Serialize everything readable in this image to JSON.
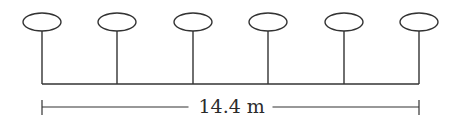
{
  "diagram": {
    "type": "lamp-post row with dimension",
    "post_count": 6,
    "post_centers_x": [
      42,
      117,
      193,
      268,
      344,
      419
    ],
    "ellipse": {
      "cy": 22,
      "rx": 19,
      "ry": 9
    },
    "stem_bottom_y": 84,
    "base_line_y": 84,
    "dimension": {
      "y": 107,
      "x_start": 42,
      "x_end": 419,
      "label": "14.4 m"
    },
    "stroke_color": "#333333"
  }
}
